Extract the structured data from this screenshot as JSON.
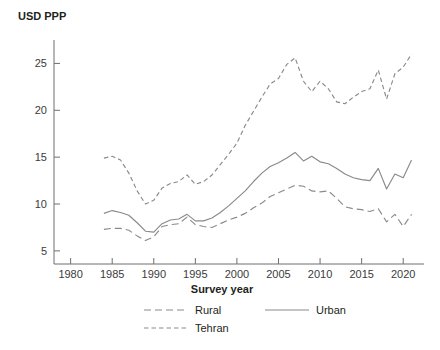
{
  "chart_data": {
    "type": "line",
    "title": "",
    "xlabel": "Survey year",
    "ylabel": "USD PPP",
    "xlim": [
      1978,
      2022.5
    ],
    "ylim": [
      3.6,
      27.5
    ],
    "xticks": [
      1980,
      1985,
      1990,
      1995,
      2000,
      2005,
      2010,
      2015,
      2020
    ],
    "yticks": [
      5,
      10,
      15,
      20,
      25
    ],
    "xtick_labels": [
      "1980",
      "1985",
      "1990",
      "1995",
      "2000",
      "2005",
      "2010",
      "2015",
      "2020"
    ],
    "ytick_labels": [
      "5",
      "10",
      "15",
      "20",
      "25"
    ],
    "grid": false,
    "legend_position": "below-axes",
    "x": [
      1984,
      1985,
      1986,
      1987,
      1988,
      1989,
      1990,
      1991,
      1992,
      1993,
      1994,
      1995,
      1996,
      1997,
      1998,
      1999,
      2000,
      2001,
      2002,
      2003,
      2004,
      2005,
      2006,
      2007,
      2008,
      2009,
      2010,
      2011,
      2012,
      2013,
      2014,
      2015,
      2016,
      2017,
      2018,
      2019,
      2020,
      2021
    ],
    "series": [
      {
        "name": "Rural",
        "style": "long-dash",
        "color": "#8a8a8a",
        "values": [
          7.3,
          7.4,
          7.4,
          7.2,
          6.6,
          6.1,
          6.5,
          7.6,
          7.8,
          7.9,
          8.6,
          7.8,
          7.6,
          7.5,
          7.9,
          8.3,
          8.6,
          9.0,
          9.6,
          10.1,
          10.8,
          11.2,
          11.6,
          12.0,
          11.9,
          11.4,
          11.3,
          11.4,
          10.6,
          9.7,
          9.5,
          9.4,
          9.2,
          9.5,
          8.1,
          8.9,
          7.6,
          8.9
        ]
      },
      {
        "name": "Urban",
        "style": "solid",
        "color": "#8a8a8a",
        "values": [
          9.0,
          9.3,
          9.1,
          8.8,
          8.0,
          7.1,
          7.0,
          7.9,
          8.3,
          8.4,
          8.9,
          8.2,
          8.2,
          8.5,
          9.1,
          9.8,
          10.6,
          11.4,
          12.4,
          13.3,
          14.0,
          14.4,
          14.9,
          15.5,
          14.6,
          15.1,
          14.5,
          14.3,
          13.8,
          13.2,
          12.8,
          12.6,
          12.5,
          13.8,
          11.6,
          13.2,
          12.8,
          14.7
        ]
      },
      {
        "name": "Tehran",
        "style": "short-dash",
        "color": "#8a8a8a",
        "values": [
          14.9,
          15.1,
          14.7,
          13.3,
          11.4,
          10.0,
          10.4,
          11.7,
          12.2,
          12.4,
          13.1,
          12.1,
          12.4,
          13.1,
          14.2,
          15.3,
          16.5,
          18.4,
          19.9,
          21.4,
          22.8,
          23.4,
          24.9,
          25.6,
          23.1,
          22.0,
          23.1,
          22.3,
          20.9,
          20.7,
          21.4,
          22.0,
          22.3,
          24.3,
          21.2,
          23.9,
          24.6,
          26.0
        ]
      }
    ],
    "legend": [
      {
        "label": "Rural",
        "style": "long-dash"
      },
      {
        "label": "Urban",
        "style": "solid"
      },
      {
        "label": "Tehran",
        "style": "short-dash"
      }
    ]
  }
}
